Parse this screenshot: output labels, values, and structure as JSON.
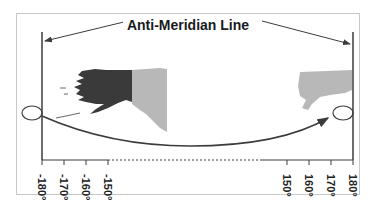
{
  "diagram": {
    "title": "Anti-Meridian Line",
    "left_ticks": [
      {
        "value": -180,
        "label": "-180°"
      },
      {
        "value": -170,
        "label": "-170°"
      },
      {
        "value": -160,
        "label": "-160°"
      },
      {
        "value": -150,
        "label": "-150°"
      }
    ],
    "right_ticks": [
      {
        "value": 150,
        "label": "150°"
      },
      {
        "value": 160,
        "label": "160°"
      },
      {
        "value": 170,
        "label": "170°"
      },
      {
        "value": 180,
        "label": "180°"
      }
    ],
    "regions": [
      {
        "name": "alaska-us",
        "shade": "dark",
        "color": "#3a3a3a"
      },
      {
        "name": "canada-yukon",
        "shade": "light",
        "color": "#b8b8b8"
      },
      {
        "name": "russia-chukotka",
        "shade": "light",
        "color": "#b8b8b8"
      }
    ],
    "colors": {
      "line": "#3c3c3c",
      "frame": "#c8c8c8"
    }
  }
}
